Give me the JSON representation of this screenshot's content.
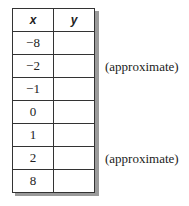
{
  "table": {
    "headers": [
      "x",
      "y"
    ],
    "rows": [
      {
        "x": "−8",
        "y": ""
      },
      {
        "x": "−2",
        "y": ""
      },
      {
        "x": "−1",
        "y": ""
      },
      {
        "x": "0",
        "y": ""
      },
      {
        "x": "1",
        "y": ""
      },
      {
        "x": "2",
        "y": ""
      },
      {
        "x": "8",
        "y": ""
      }
    ]
  },
  "notes": [
    {
      "row": "−2",
      "text": "(approximate)"
    },
    {
      "row": "2",
      "text": "(approximate)"
    }
  ]
}
